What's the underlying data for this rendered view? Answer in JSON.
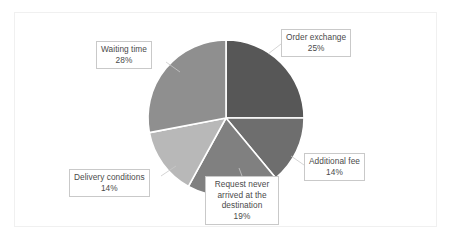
{
  "figure": {
    "background_color": "#ffffff",
    "frame_color": "#f0f0f0",
    "label_text_color": "#4a4a4a",
    "label_box_border_color": "#c9c9c9",
    "slice_separator_color": "#ffffff"
  },
  "chart_data": {
    "type": "pie",
    "title": "",
    "subtitle": "",
    "xlabel": "",
    "ylabel": "",
    "grid": false,
    "legend_position": "none",
    "label_style": "callout-boxes-with-leader-lines",
    "start_angle_deg": 0,
    "direction": "clockwise",
    "units": "percent",
    "total": 100,
    "categories": [
      "Order exchange",
      "Additional fee",
      "Request never arrived at the destination",
      "Delivery conditions",
      "Waiting time"
    ],
    "values": [
      25,
      14,
      19,
      14,
      28
    ],
    "value_labels": [
      "25%",
      "14%",
      "19%",
      "14%",
      "28%"
    ],
    "colors": [
      "#575757",
      "#6e6e6e",
      "#808080",
      "#b8b8b8",
      "#8f8f8f"
    ],
    "slices": [
      {
        "label": "Order exchange",
        "value": 25,
        "value_label": "25%",
        "color": "#575757",
        "start_angle_deg": 0,
        "end_angle_deg": 90
      },
      {
        "label": "Additional fee",
        "value": 14,
        "value_label": "14%",
        "color": "#6e6e6e",
        "start_angle_deg": 90,
        "end_angle_deg": 140.4
      },
      {
        "label": "Request never arrived at the destination",
        "value": 19,
        "value_label": "19%",
        "color": "#808080",
        "start_angle_deg": 140.4,
        "end_angle_deg": 208.8
      },
      {
        "label": "Delivery conditions",
        "value": 14,
        "value_label": "14%",
        "color": "#b8b8b8",
        "start_angle_deg": 208.8,
        "end_angle_deg": 259.2
      },
      {
        "label": "Waiting time",
        "value": 28,
        "value_label": "28%",
        "color": "#8f8f8f",
        "start_angle_deg": 259.2,
        "end_angle_deg": 360
      }
    ]
  },
  "callouts": {
    "order_exchange": {
      "label": "Order exchange",
      "percent": "25%"
    },
    "waiting_time": {
      "label": "Waiting time",
      "percent": "28%"
    },
    "additional_fee": {
      "label": "Additional fee",
      "percent": "14%"
    },
    "delivery_conditions": {
      "label": "Delivery conditions",
      "percent": "14%"
    },
    "request_never": {
      "label": "Request never arrived at the destination",
      "percent": "19%"
    }
  }
}
